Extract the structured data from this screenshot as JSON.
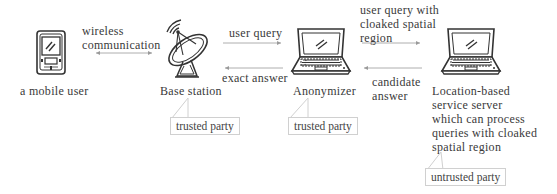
{
  "nodes": {
    "mobile_user": {
      "label": "a mobile user",
      "icon": "pda-icon"
    },
    "base_station": {
      "label": "Base station",
      "icon": "satellite-dish-icon",
      "trust": "trusted party"
    },
    "anonymizer": {
      "label": "Anonymizer",
      "icon": "laptop-icon",
      "trust": "trusted party"
    },
    "lbs_server": {
      "label_lines": [
        "Location-based",
        "service server",
        "which can process",
        "queries with cloaked",
        "spatial region"
      ],
      "icon": "laptop-icon",
      "trust": "untrusted party"
    }
  },
  "edges": {
    "wireless": {
      "lines": [
        "wireless",
        "communication"
      ],
      "direction": "bidirectional"
    },
    "user_query": {
      "label": "user query",
      "direction": "forward"
    },
    "exact_answer": {
      "label": "exact answer",
      "direction": "backward"
    },
    "cloaked_query": {
      "lines": [
        "user query with",
        "cloaked spatial",
        "region"
      ],
      "direction": "forward"
    },
    "candidate_answer": {
      "lines": [
        "candidate",
        "answer"
      ],
      "direction": "backward"
    }
  },
  "colors": {
    "line": "#9a9a9a",
    "text": "#3a3a3a",
    "callout_border": "#d0d0d0"
  }
}
